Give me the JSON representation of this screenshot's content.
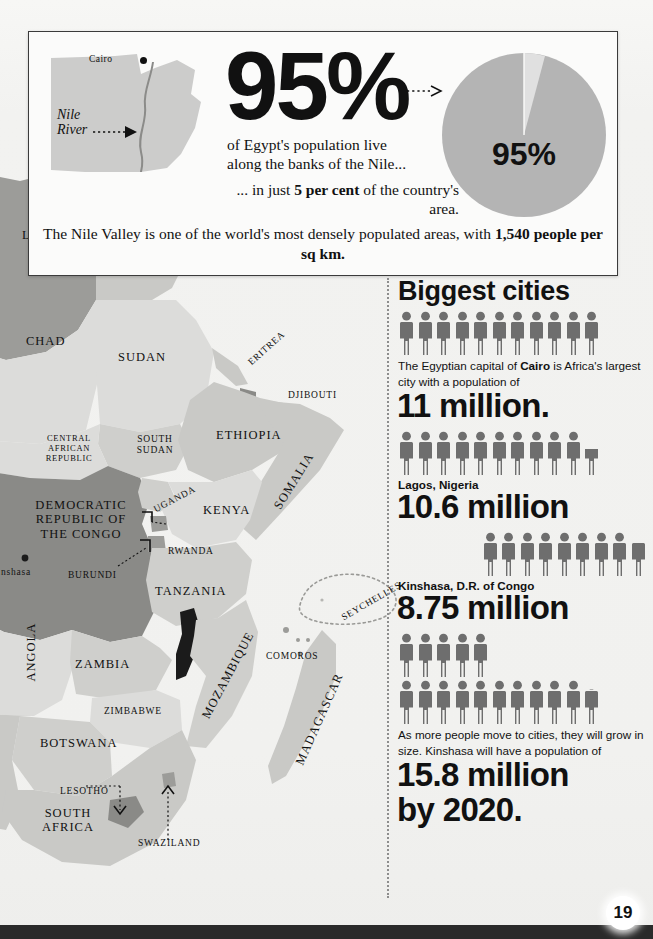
{
  "page": {
    "number": "19",
    "background_color": "#f2f2f0"
  },
  "top_panel": {
    "inset_map": {
      "country": "Egypt",
      "capital_label": "Cairo",
      "river_label_line1": "Nile",
      "river_label_line2": "River"
    },
    "headline_percent": "95%",
    "lead_text_line1": "of Egypt's population live",
    "lead_text_line2": "along the banks of the Nile...",
    "mid_text_prefix": "... in just ",
    "mid_text_bold": "5 per cent",
    "mid_text_suffix": " of the country's area.",
    "foot_text_prefix": "The Nile Valley is one of the world's most densely populated areas, with ",
    "foot_text_bold": "1,540 people per sq km.",
    "pie_label": "95%",
    "pie_colors": {
      "major_slice": "#b4b4b4",
      "minor_slice": "#dcdcdc"
    }
  },
  "chart_data": [
    {
      "type": "pie",
      "title": "95% of Egypt's population live along the banks of the Nile",
      "labels": [
        "Population along the Nile",
        "Rest of Egypt"
      ],
      "values": [
        95,
        5
      ],
      "value_labels": [
        "95%",
        ""
      ],
      "colors": [
        "#b4b4b4",
        "#dcdcdc"
      ],
      "legend": "none"
    },
    {
      "type": "bar",
      "title": "Biggest cities",
      "subtitle": "Pictogram: each figure = 1 million people",
      "unit": "million people",
      "categories": [
        "Cairo, Egypt",
        "Lagos, Nigeria",
        "Kinshasa, D.R. of Congo",
        "Kinshasa (projected 2020)"
      ],
      "values": [
        11,
        10.6,
        8.75,
        15.8
      ],
      "value_labels": [
        "11 million.",
        "10.6 million",
        "8.75 million",
        "15.8 million"
      ],
      "icon_unit": 1,
      "ylabel": "",
      "xlabel": ""
    }
  ],
  "cities_section": {
    "heading": "Biggest cities",
    "entries": [
      {
        "id": "cairo",
        "icons_full": 11,
        "icons_partial": 0,
        "align": "left",
        "body_prefix": "The Egyptian capital of ",
        "body_bold": "Cairo",
        "body_suffix": " is Africa's largest city with a population of",
        "label": "",
        "value": "11 million."
      },
      {
        "id": "lagos",
        "icons_full": 10,
        "icons_partial": 1,
        "align": "left",
        "body_prefix": "",
        "body_bold": "",
        "body_suffix": "",
        "label": "Lagos, Nigeria",
        "value": "10.6 million"
      },
      {
        "id": "kinshasa",
        "icons_full": 8,
        "icons_partial": 1,
        "align": "right",
        "body_prefix": "",
        "body_bold": "",
        "body_suffix": "",
        "label": "Kinshasa, D.R. of Congo",
        "value": "8.75 million"
      },
      {
        "id": "kinshasa-2020",
        "icons_full_row1": 5,
        "icons_full_row2": 10,
        "icons_partial": 1,
        "align": "left",
        "body_text": "As more people move to cities, they will grow in size. Kinshasa will have a population of",
        "label": "",
        "value_line1": "15.8 million",
        "value_line2": "by 2020."
      }
    ],
    "icon_color": "#6e6e6e"
  },
  "map": {
    "labels": [
      {
        "text": "LIBYA",
        "x": 22,
        "y": 228,
        "size": "lg"
      },
      {
        "text": "EGYPT",
        "x": 108,
        "y": 243,
        "size": "lg"
      },
      {
        "text": "Cairo",
        "x": 103,
        "y": 206,
        "size": "sm"
      },
      {
        "text": "CHAD",
        "x": 26,
        "y": 334,
        "size": "lg"
      },
      {
        "text": "SUDAN",
        "x": 118,
        "y": 350,
        "size": "lg"
      },
      {
        "text": "ERITREA",
        "x": 244,
        "y": 343,
        "size": "sm",
        "rot": -42
      },
      {
        "text": "DJIBOUTI",
        "x": 288,
        "y": 390,
        "size": "sm"
      },
      {
        "text": "ETHIOPIA",
        "x": 216,
        "y": 428,
        "size": "lg"
      },
      {
        "text": "CENTRAL AFRICAN REPUBLIC",
        "x": 30,
        "y": 434,
        "size": "xs"
      },
      {
        "text": "SOUTH SUDAN",
        "x": 127,
        "y": 434,
        "size": "sm"
      },
      {
        "text": "SOMALIA",
        "x": 272,
        "y": 474,
        "size": "lg",
        "rot": -58
      },
      {
        "text": "DEMOCRATIC REPUBLIC OF THE CONGO",
        "x": 28,
        "y": 500,
        "size": "lg"
      },
      {
        "text": "UGANDA",
        "x": 154,
        "y": 494,
        "size": "sm",
        "rot": -28
      },
      {
        "text": "KENYA",
        "x": 203,
        "y": 503,
        "size": "lg"
      },
      {
        "text": "RWANDA",
        "x": 168,
        "y": 546,
        "size": "sm"
      },
      {
        "text": "BURUNDI",
        "x": 70,
        "y": 570,
        "size": "sm"
      },
      {
        "text": "Kinshasa",
        "x": -8,
        "y": 567,
        "size": "sm"
      },
      {
        "text": "TANZANIA",
        "x": 155,
        "y": 584,
        "size": "lg"
      },
      {
        "text": "SEYCHELLES",
        "x": 338,
        "y": 596,
        "size": "sm",
        "rot": -30
      },
      {
        "text": "ANGOLA",
        "x": 21,
        "y": 627,
        "size": "lg",
        "rot": -90
      },
      {
        "text": "ZAMBIA",
        "x": 75,
        "y": 657,
        "size": "lg"
      },
      {
        "text": "COMOROS",
        "x": 268,
        "y": 651,
        "size": "sm"
      },
      {
        "text": "MOZAMBIQUE",
        "x": 195,
        "y": 655,
        "size": "lg",
        "rot": -62
      },
      {
        "text": "MADAGASCAR",
        "x": 288,
        "y": 700,
        "size": "lg",
        "rot": -66
      },
      {
        "text": "ZIMBABWE",
        "x": 104,
        "y": 706,
        "size": "sm"
      },
      {
        "text": "BOTSWANA",
        "x": 40,
        "y": 736,
        "size": "lg"
      },
      {
        "text": "LESOTHO",
        "x": 63,
        "y": 790,
        "size": "sm"
      },
      {
        "text": "SOUTH AFRICA",
        "x": 34,
        "y": 810,
        "size": "lg"
      },
      {
        "text": "SWAZILAND",
        "x": 140,
        "y": 840,
        "size": "sm"
      }
    ],
    "colors": {
      "land_light": "#dcdcda",
      "land_mid": "#c9c9c6",
      "land_dark": "#9c9c99",
      "land_darker": "#8a8a87",
      "water": "#f2f2f0",
      "highlight": "#1b1b1b"
    }
  }
}
